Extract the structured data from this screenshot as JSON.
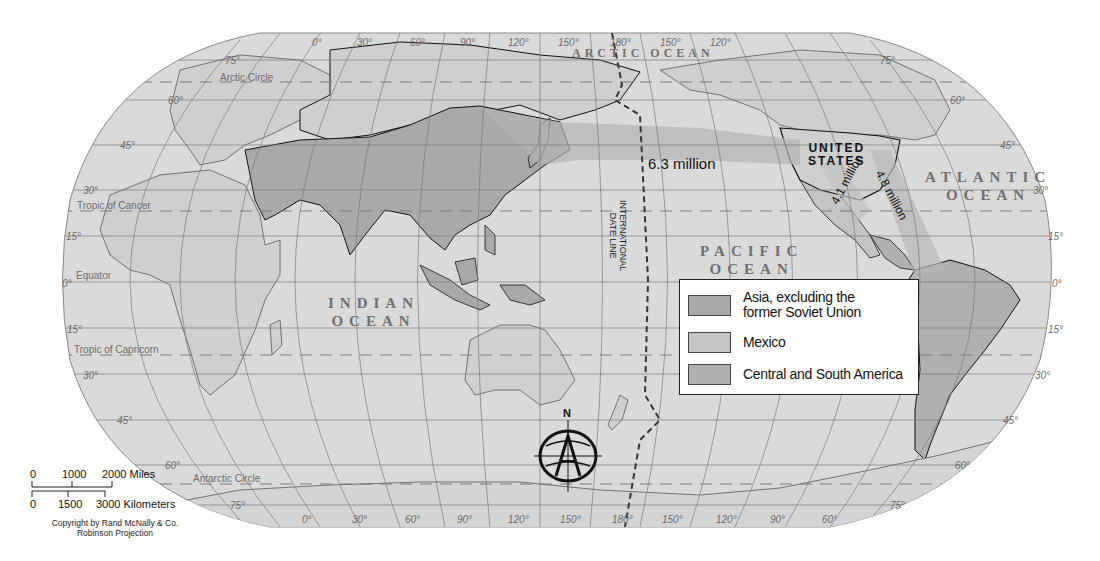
{
  "map": {
    "projection": "Robinson Projection",
    "copyright": "Copyright by Rand McNally & Co.",
    "colors": {
      "background": "#ffffff",
      "ocean": "#d9d9d9",
      "land": "#cdcdcd",
      "asia": "#a9a9a9",
      "mexico": "#c4c4c4",
      "central_south_america": "#b0b0b0",
      "flow_asia": "#b4b4b4",
      "flow_mexico": "#c0c0c0",
      "flow_latam": "#b8b8b8",
      "grid": "#7a7a7a",
      "coast": "#444444",
      "legend_border": "#222222"
    },
    "ocean_labels": {
      "arctic": "ARCTIC OCEAN",
      "atlantic_1": "ATLANTIC",
      "atlantic_2": "OCEAN",
      "pacific_1": "PACIFIC",
      "pacific_2": "OCEAN",
      "indian_1": "INDIAN",
      "indian_2": "OCEAN"
    },
    "country_labels": {
      "us_1": "UNITED",
      "us_2": "STATES"
    },
    "flows": [
      {
        "from": "Asia, excluding the former Soviet Union",
        "to": "United States",
        "label": "6.3 million"
      },
      {
        "from": "Mexico",
        "to": "United States",
        "label": "4.1 million"
      },
      {
        "from": "Central and South America",
        "to": "United States",
        "label": "4.8 million"
      }
    ],
    "special_lines": {
      "arctic_circle": "Arctic Circle",
      "tropic_cancer": "Tropic of Cancer",
      "equator": "Equator",
      "tropic_capricorn": "Tropic of Capricorn",
      "antarctic_circle": "Antarctic Circle",
      "date_line_1": "INTERNATIONAL",
      "date_line_2": "DATE LINE"
    },
    "latitude_labels": {
      "left": [
        "75°",
        "60°",
        "45°",
        "30°",
        "15°",
        "0°",
        "15°",
        "30°",
        "45°",
        "60°",
        "75°"
      ],
      "right": [
        "75°",
        "60°",
        "45°",
        "30°",
        "15°",
        "0°",
        "15°",
        "30°",
        "45°",
        "60°",
        "75°"
      ]
    },
    "longitude_labels": {
      "top": [
        "0°",
        "30°",
        "60°",
        "90°",
        "120°",
        "150°",
        "180°",
        "150°",
        "120°"
      ],
      "bottom": [
        "0°",
        "30°",
        "60°",
        "90°",
        "120°",
        "150°",
        "180°",
        "150°",
        "120°",
        "90°",
        "60°"
      ]
    },
    "compass": {
      "north_label": "N"
    },
    "legend": {
      "items": [
        {
          "label_1": "Asia, excluding the",
          "label_2": "former Soviet Union",
          "color": "#a9a9a9"
        },
        {
          "label_1": "Mexico",
          "label_2": "",
          "color": "#c4c4c4"
        },
        {
          "label_1": "Central and South America",
          "label_2": "",
          "color": "#b0b0b0"
        }
      ]
    },
    "scale_bar": {
      "miles": [
        "0",
        "1000",
        "2000 Miles"
      ],
      "kilometers": [
        "0",
        "1500",
        "3000 Kilometers"
      ]
    }
  }
}
